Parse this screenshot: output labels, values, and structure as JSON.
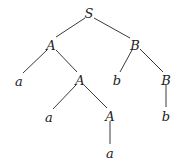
{
  "diagram": {
    "type": "parse-tree",
    "nodes": [
      {
        "id": "n0",
        "label": "S",
        "x": 89,
        "y": 13
      },
      {
        "id": "n1",
        "label": "A",
        "x": 51,
        "y": 45
      },
      {
        "id": "n2",
        "label": "B",
        "x": 135,
        "y": 45
      },
      {
        "id": "n3",
        "label": "a",
        "x": 19,
        "y": 81
      },
      {
        "id": "n4",
        "label": "A",
        "x": 80,
        "y": 80
      },
      {
        "id": "n5",
        "label": "b",
        "x": 117,
        "y": 80
      },
      {
        "id": "n6",
        "label": "B",
        "x": 166,
        "y": 80
      },
      {
        "id": "n7",
        "label": "a",
        "x": 49,
        "y": 117
      },
      {
        "id": "n8",
        "label": "A",
        "x": 110,
        "y": 116
      },
      {
        "id": "n9",
        "label": "b",
        "x": 166,
        "y": 116
      },
      {
        "id": "n10",
        "label": "a",
        "x": 110,
        "y": 153
      }
    ],
    "edges": [
      {
        "from": "n0",
        "to": "n1",
        "x1": 85,
        "y1": 18,
        "x2": 56,
        "y2": 37
      },
      {
        "from": "n0",
        "to": "n2",
        "x1": 94,
        "y1": 18,
        "x2": 130,
        "y2": 38
      },
      {
        "from": "n1",
        "to": "n3",
        "x1": 47,
        "y1": 50,
        "x2": 23,
        "y2": 73
      },
      {
        "from": "n1",
        "to": "n4",
        "x1": 56,
        "y1": 50,
        "x2": 77,
        "y2": 72
      },
      {
        "from": "n2",
        "to": "n5",
        "x1": 132,
        "y1": 50,
        "x2": 120,
        "y2": 72
      },
      {
        "from": "n2",
        "to": "n6",
        "x1": 140,
        "y1": 49,
        "x2": 163,
        "y2": 72
      },
      {
        "from": "n4",
        "to": "n7",
        "x1": 76,
        "y1": 85,
        "x2": 53,
        "y2": 109
      },
      {
        "from": "n4",
        "to": "n8",
        "x1": 84,
        "y1": 85,
        "x2": 107,
        "y2": 108
      },
      {
        "from": "n6",
        "to": "n9",
        "x1": 166,
        "y1": 85,
        "x2": 166,
        "y2": 107
      },
      {
        "from": "n8",
        "to": "n10",
        "x1": 110,
        "y1": 121,
        "x2": 110,
        "y2": 144
      }
    ]
  }
}
